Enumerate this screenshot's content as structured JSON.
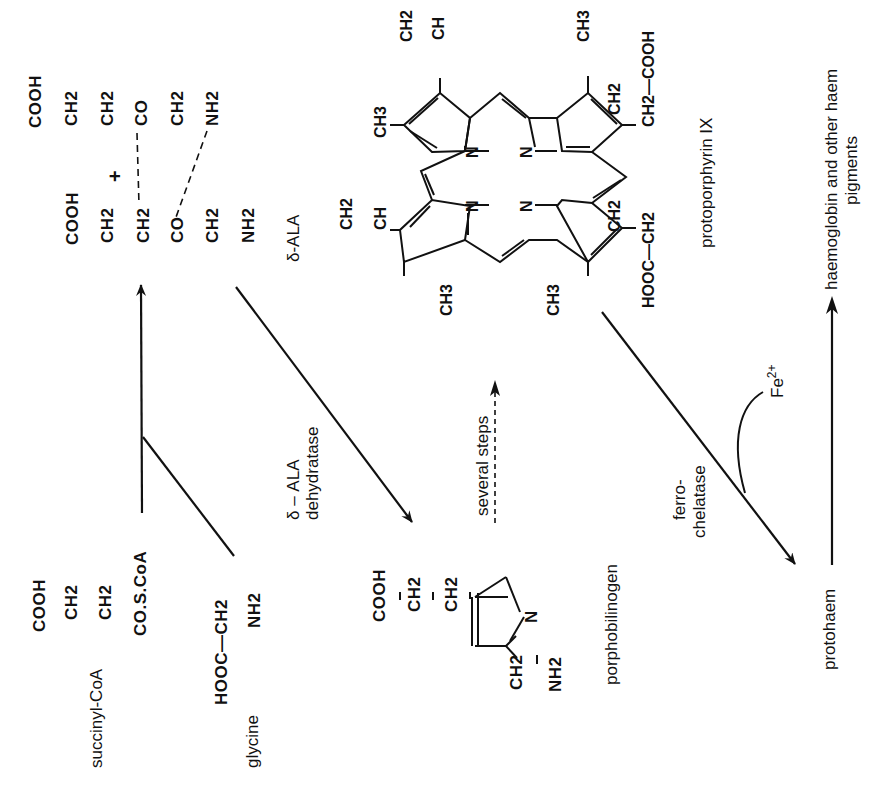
{
  "figure": {
    "orientation": "rotated -90deg (reads bottom-to-top)",
    "line_color": "#111111",
    "background": "#ffffff"
  },
  "substrates": {
    "succinyl_coa": {
      "name": "succinyl-CoA",
      "formula_top": "COOH",
      "chain": [
        "CH2",
        "CH2",
        "CO.S.CoA"
      ]
    },
    "glycine": {
      "name": "glycine",
      "formula": "HOOC—CH2",
      "substituent": "NH2"
    }
  },
  "delta_ala": {
    "name": "δ-ALA",
    "molecule_a": [
      "COOH",
      "CH2",
      "CH2",
      "CO",
      "CH2",
      "NH2"
    ],
    "molecule_b": [
      "COOH",
      "CH2",
      "CH2",
      "CO",
      "CH2",
      "NH2"
    ],
    "plus": "+"
  },
  "dehydratase": {
    "line1": "δ – ALA",
    "line2": "dehydratase"
  },
  "porphobilinogen": {
    "name": "porphobilinogen",
    "side_chain": [
      "COOH",
      "CH2",
      "CH2"
    ],
    "ring_atom": "N",
    "substituent": [
      "CH2",
      "NH2"
    ]
  },
  "several_steps": {
    "label": "several steps"
  },
  "protoporphyrin": {
    "name": "protoporphyrin IX",
    "substituents": {
      "vinyl_top": [
        "CH2",
        "CH"
      ],
      "vinyl_left": [
        "CH2",
        "CH"
      ],
      "methyl_labels": [
        "CH3",
        "CH3",
        "CH3",
        "CH3"
      ],
      "propionate_right": [
        "CH2",
        "CH2—COOH"
      ],
      "propionate_bottom": [
        "CH2",
        "HOOC—CH2"
      ]
    },
    "nitrogen_label": "N"
  },
  "ferrochelatase": {
    "line1": "ferro-",
    "line2": "chelatase",
    "cofactor": "Fe",
    "cofactor_charge": "2+"
  },
  "products": {
    "protohaem": "protohaem",
    "final_line1": "haemoglobin and other haem",
    "final_line2": "pigments"
  }
}
